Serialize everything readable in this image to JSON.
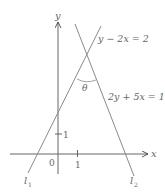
{
  "diagram": {
    "axes": {
      "x_label": "x",
      "y_label": "y",
      "origin_label": "0",
      "x_tick_label": "1",
      "y_tick_label": "1"
    },
    "lines": [
      {
        "name": "l1",
        "label_main": "l",
        "label_sub": "1",
        "equation": "y − 2x = 2"
      },
      {
        "name": "l2",
        "label_main": "l",
        "label_sub": "2",
        "equation": "2y + 5x = 17"
      }
    ],
    "angle_label": "θ",
    "colors": {
      "line": "#8a8a8a",
      "axis": "#444444",
      "text": "#666666",
      "background": "#ffffff"
    }
  }
}
